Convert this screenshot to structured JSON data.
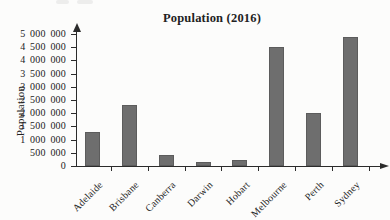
{
  "page": {
    "background": "#fcfcfb"
  },
  "chart_data": {
    "type": "bar",
    "title": "Population (2016)",
    "xlabel": "",
    "ylabel": "Population",
    "categories": [
      "Adelaide",
      "Brisbane",
      "Canberra",
      "Darwin",
      "Hobart",
      "Melbourne",
      "Perth",
      "Sydney"
    ],
    "values": [
      1300000,
      2300000,
      400000,
      150000,
      220000,
      4500000,
      2000000,
      4900000
    ],
    "ylim": [
      0,
      5000000
    ],
    "ytick_step": 500000,
    "ytick_labels": [
      "0",
      "500 000",
      "1 000 000",
      "1 500 000",
      "2 000 000",
      "2 500 000",
      "3 000 000",
      "3 500 000",
      "4 000 000",
      "4 500 000",
      "5 000 000"
    ],
    "grid": false,
    "legend": null,
    "x_label_rotation_deg": -45,
    "bar_color": "#6e6e6e",
    "bar_border_color": "#5c5c5c",
    "axis_color": "#2b2b2b",
    "text_color": "#222222"
  }
}
